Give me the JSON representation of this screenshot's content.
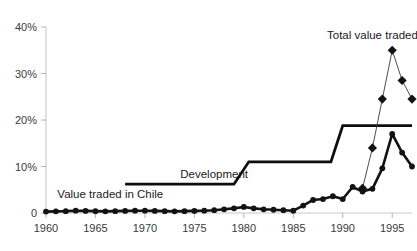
{
  "chart_data": {
    "type": "line",
    "title": "",
    "subtitle": "",
    "xlabel": "",
    "ylabel": "",
    "grid": false,
    "legend_position": "inline-annotations",
    "xlim": [
      1960,
      1997
    ],
    "ylim": [
      0,
      40
    ],
    "y_ticks": [
      0,
      10,
      20,
      30,
      40
    ],
    "y_tick_labels": [
      "0",
      "10%",
      "20%",
      "30%",
      "40%"
    ],
    "x_ticks": [
      1960,
      1965,
      1970,
      1975,
      1980,
      1985,
      1990,
      1995
    ],
    "x_tick_labels": [
      "1960",
      "1965",
      "1970",
      "1975",
      "1980",
      "1985",
      "1990",
      "1995"
    ],
    "annotations": [
      {
        "text": "Total value traded",
        "x": 1993.0,
        "y": 37.5
      },
      {
        "text": "Development",
        "x": 1977.0,
        "y": 7.6
      },
      {
        "text": "Value traded in Chile",
        "x": 1966.5,
        "y": 3.2
      }
    ],
    "series": [
      {
        "name": "Value traded in Chile",
        "marker": "circle",
        "line_style": "solid-thick",
        "color": "#121212",
        "x": [
          1960,
          1961,
          1962,
          1963,
          1964,
          1965,
          1966,
          1967,
          1968,
          1969,
          1970,
          1971,
          1972,
          1973,
          1974,
          1975,
          1976,
          1977,
          1978,
          1979,
          1980,
          1981,
          1982,
          1983,
          1984,
          1985,
          1986,
          1987,
          1988,
          1989,
          1990,
          1991,
          1992,
          1993,
          1994,
          1995,
          1996,
          1997
        ],
        "values": [
          0.3,
          0.35,
          0.4,
          0.5,
          0.45,
          0.4,
          0.35,
          0.4,
          0.45,
          0.5,
          0.5,
          0.45,
          0.4,
          0.35,
          0.4,
          0.45,
          0.5,
          0.6,
          0.8,
          1.0,
          1.3,
          1.0,
          0.8,
          0.7,
          0.6,
          0.5,
          1.6,
          2.8,
          3.0,
          3.6,
          3.0,
          5.6,
          4.6,
          5.2,
          9.6,
          17.0,
          13.0,
          10.0
        ]
      },
      {
        "name": "Total value traded",
        "marker": "diamond",
        "line_style": "solid-thin",
        "color": "#3a3a3a",
        "x": [
          1992,
          1993,
          1994,
          1995,
          1996,
          1997
        ],
        "values": [
          5.3,
          14.0,
          24.5,
          35.0,
          28.5,
          24.5
        ]
      },
      {
        "name": "Development",
        "marker": "none",
        "line_style": "step",
        "color": "#0d0d0d",
        "x": [
          1968,
          1979,
          1980.5,
          1988.8,
          1990,
          1997
        ],
        "values": [
          6.2,
          6.2,
          11.0,
          11.0,
          18.8,
          18.8
        ]
      }
    ]
  },
  "labels": {
    "total_value_traded": "Total value traded",
    "development": "Development",
    "value_traded_in_chile": "Value traded in Chile"
  }
}
